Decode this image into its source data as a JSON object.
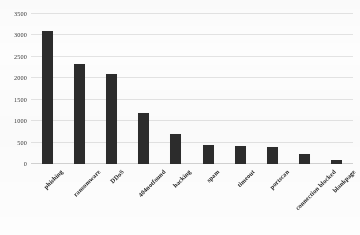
{
  "chart_data": {
    "type": "bar",
    "title": "",
    "xlabel": "",
    "ylabel": "",
    "ylim": [
      0,
      3500
    ],
    "yticks": [
      0,
      500,
      1000,
      1500,
      2000,
      2500,
      3000,
      3500
    ],
    "ytick_labels": [
      "0",
      "500",
      "1000",
      "1500",
      "2000",
      "2500",
      "3000",
      "3500"
    ],
    "grid": true,
    "legend": null,
    "categories": [
      "phishing",
      "ransomware",
      "DDoS",
      "404notfound",
      "hacking",
      "spam",
      "timeout",
      "portscan",
      "connection blocked",
      "blankpage"
    ],
    "values": [
      3100,
      2330,
      2110,
      1180,
      690,
      450,
      420,
      400,
      230,
      95
    ],
    "bar_color": "#2c2c2c",
    "background_color": "#ffffff",
    "gridline_color": "#e3e3e3"
  }
}
